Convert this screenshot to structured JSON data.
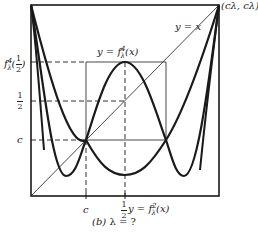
{
  "figure": {
    "caption_part": "(b)",
    "caption_eq": "λ = ?",
    "colors": {
      "ink": "#1a1a1a",
      "background": "#ffffff"
    }
  },
  "labels": {
    "identity_line": "y = x",
    "corner_point": "(c_λ, c_λ)",
    "corner_point_display": "(cλ, cλ)",
    "f4_curve": "y = f_λ^4(x)",
    "f4_prefix": "y = f",
    "f4_sup": "4",
    "f4_sub": "λ",
    "f4_suffix": "(x)",
    "f2_curve": "y = f_λ^2(x)",
    "f2_prefix": "y = f",
    "f2_sup": "2",
    "f2_sub": "λ",
    "f2_suffix": "(x)",
    "y_tick_f4_half": "f_λ^4(1/2)",
    "y_tick_f4_f": "f",
    "y_tick_f4_sup": "4",
    "y_tick_f4_sub": "λ",
    "y_tick_half_num": "1",
    "y_tick_half_den": "2",
    "y_tick_c": "c",
    "x_tick_c": "c",
    "x_tick_half_num": "1",
    "x_tick_half_den": "2"
  }
}
